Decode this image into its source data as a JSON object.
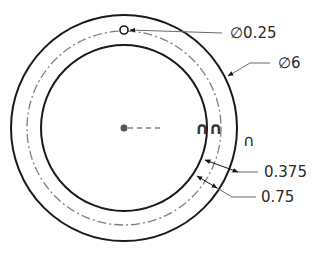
{
  "drawing": {
    "type": "ring-gasket-technical-drawing",
    "center": {
      "x": 124,
      "y": 128
    },
    "outer_circle_radius_px": 113,
    "bolt_circle_radius_px": 97,
    "inner_circle_radius_px": 83,
    "hole_radius_px": 4,
    "colors": {
      "outline": "#1a1a1a",
      "centerline": "#808080",
      "leader": "#6a6a6a",
      "text": "#2a2a2a"
    }
  },
  "dimensions": {
    "hole_diameter": {
      "label": "∅0.25"
    },
    "outer_diameter": {
      "label": "∅6"
    },
    "offset": {
      "label": "0.375"
    },
    "width": {
      "label": "0.75"
    }
  },
  "symbols": {
    "double_arc": "∩∩",
    "single_arc": "∩"
  }
}
